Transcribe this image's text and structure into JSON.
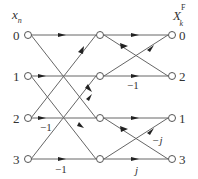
{
  "header": {
    "left_title": "x",
    "left_sub": "n",
    "right_title": "X",
    "right_sub": "k",
    "right_sup": "F"
  },
  "inputs": [
    "0",
    "1",
    "2",
    "3"
  ],
  "outputs": [
    "0",
    "2",
    "1",
    "3"
  ],
  "weights": {
    "stage1_2_to_m2": "−1",
    "stage1_3_to_m3": "−1",
    "stage2_m1_to_r2": "−1",
    "stage2_m3_to_r1": "−j",
    "stage2_m3_to_r3": "j"
  },
  "colors": {
    "line": "#555555",
    "node_fill": "#ffffff"
  }
}
